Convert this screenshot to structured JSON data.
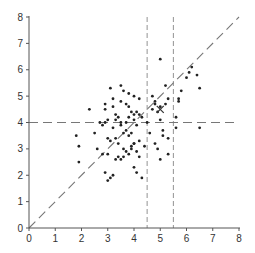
{
  "chart_data": {
    "type": "scatter",
    "title": "",
    "xlabel": "",
    "ylabel": "",
    "xlim": [
      0,
      8
    ],
    "ylim": [
      0,
      8
    ],
    "xticks": [
      0,
      1,
      2,
      3,
      4,
      5,
      6,
      7,
      8
    ],
    "yticks": [
      0,
      1,
      2,
      3,
      4,
      5,
      6,
      7,
      8
    ],
    "grid": false,
    "legend": null,
    "colors": {
      "points": "#222222",
      "axes": "#555555",
      "reference_lines": "#777777"
    },
    "series": [
      {
        "name": "points",
        "marker": "dot",
        "x": [
          1.8,
          1.9,
          1.9,
          2.5,
          2.6,
          2.8,
          2.9,
          3.0,
          3.0,
          3.1,
          3.2,
          3.3,
          3.4,
          3.5,
          3.6,
          3.7,
          3.8,
          3.9,
          4.0,
          4.0,
          4.1,
          4.2,
          4.3,
          2.3,
          2.9,
          2.9,
          2.9,
          2.7,
          2.8,
          3.0,
          3.1,
          3.2,
          3.3,
          3.4,
          3.5,
          3.6,
          3.7,
          3.8,
          3.9,
          4.0,
          4.1,
          4.2,
          4.3,
          3.2,
          3.5,
          3.7,
          3.9,
          4.1,
          3.0,
          3.3,
          3.6,
          3.8,
          4.0,
          4.2,
          3.1,
          3.4,
          3.6,
          3.9,
          4.1,
          4.4,
          3.2,
          3.5,
          3.8,
          4.0,
          4.2,
          3.3,
          3.7,
          4.0,
          3.5,
          3.8,
          4.6,
          4.8,
          4.9,
          5.0,
          5.1,
          5.1,
          5.3,
          5.3,
          4.7,
          4.8,
          5.0,
          5.2,
          5.3,
          4.9,
          5.0,
          5.2,
          4.5,
          4.7,
          4.8,
          5.0,
          5.6,
          5.7,
          5.7,
          5.8,
          6.0,
          6.1,
          6.2,
          6.4,
          6.5,
          6.5,
          5.6
        ],
        "y": [
          3.5,
          3.1,
          2.5,
          3.6,
          3.0,
          2.8,
          2.1,
          1.8,
          2.8,
          1.9,
          2.0,
          2.6,
          2.7,
          2.6,
          2.7,
          2.9,
          2.8,
          3.0,
          3.2,
          2.3,
          2.1,
          2.7,
          1.9,
          4.5,
          4.7,
          4.5,
          4.0,
          4.0,
          3.9,
          4.1,
          5.3,
          4.9,
          4.3,
          4.2,
          5.4,
          5.2,
          4.7,
          4.6,
          4.4,
          4.3,
          4.4,
          4.3,
          4.2,
          3.8,
          3.9,
          3.7,
          3.6,
          3.9,
          3.4,
          3.4,
          3.6,
          3.5,
          3.2,
          3.3,
          3.3,
          3.2,
          3.0,
          3.1,
          2.9,
          3.1,
          4.6,
          4.8,
          5.1,
          5.0,
          4.9,
          4.1,
          4.0,
          4.1,
          4.0,
          4.2,
          3.6,
          3.2,
          3.0,
          2.6,
          3.7,
          3.5,
          3.4,
          2.8,
          5.0,
          4.8,
          6.4,
          5.4,
          4.9,
          4.4,
          4.6,
          4.7,
          4.0,
          4.5,
          4.7,
          4.1,
          3.8,
          4.8,
          4.9,
          5.2,
          5.7,
          5.9,
          6.1,
          5.8,
          5.3,
          3.8,
          4.2
        ],
        "color": "#222222"
      },
      {
        "name": "mean",
        "marker": "x",
        "x": [
          5.0
        ],
        "y": [
          4.5
        ],
        "color": "#333333"
      }
    ],
    "reference_lines": [
      {
        "type": "diagonal",
        "equation": "y = x",
        "from": [
          0,
          0
        ],
        "to": [
          8,
          8
        ],
        "style": "dashed"
      },
      {
        "type": "horizontal",
        "y": 4,
        "from_x": 0,
        "to_x": 8,
        "style": "dashed"
      },
      {
        "type": "vertical",
        "x": 4.5,
        "from_y": 0,
        "to_y": 8,
        "style": "dashed"
      },
      {
        "type": "vertical",
        "x": 5.5,
        "from_y": 0,
        "to_y": 8,
        "style": "dashed"
      }
    ],
    "annotations": [
      {
        "text": "X",
        "x": 5.0,
        "y": 4.5,
        "meaning": "mean marker"
      }
    ]
  },
  "axes": {
    "x_tick_labels": [
      "0",
      "1",
      "2",
      "3",
      "4",
      "5",
      "6",
      "7",
      "8"
    ],
    "y_tick_labels": [
      "0",
      "1",
      "2",
      "3",
      "4",
      "5",
      "6",
      "7",
      "8"
    ]
  }
}
